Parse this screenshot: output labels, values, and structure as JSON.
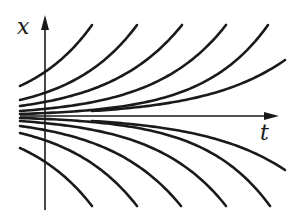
{
  "figure": {
    "type": "phase-portrait",
    "axes": {
      "x_label": "x",
      "t_label": "t",
      "origin_px": [
        45,
        116
      ],
      "t_axis_end_px": [
        277,
        116
      ],
      "x_axis_top_px": [
        45,
        18
      ],
      "x_axis_bottom_px": [
        45,
        210
      ]
    },
    "colors": {
      "ink": "#1a1a1a",
      "background": "#ffffff"
    },
    "curves_upper": [
      {
        "start": [
          20,
          86
        ],
        "end": [
          92,
          25
        ]
      },
      {
        "start": [
          20,
          100
        ],
        "end": [
          137,
          25
        ]
      },
      {
        "start": [
          20,
          106
        ],
        "end": [
          182,
          25
        ]
      },
      {
        "start": [
          20,
          111
        ],
        "end": [
          226,
          25
        ]
      },
      {
        "start": [
          20,
          114
        ],
        "end": [
          268,
          25
        ]
      },
      {
        "start": [
          92,
          111
        ],
        "end": [
          285,
          60
        ]
      }
    ],
    "curves_lower": [
      {
        "start": [
          20,
          148
        ],
        "end": [
          92,
          206
        ]
      },
      {
        "start": [
          20,
          133
        ],
        "end": [
          137,
          206
        ]
      },
      {
        "start": [
          20,
          126
        ],
        "end": [
          181,
          206
        ]
      },
      {
        "start": [
          20,
          121
        ],
        "end": [
          226,
          206
        ]
      },
      {
        "start": [
          20,
          118
        ],
        "end": [
          270,
          206
        ]
      },
      {
        "start": [
          92,
          121
        ],
        "end": [
          285,
          170
        ]
      }
    ]
  }
}
